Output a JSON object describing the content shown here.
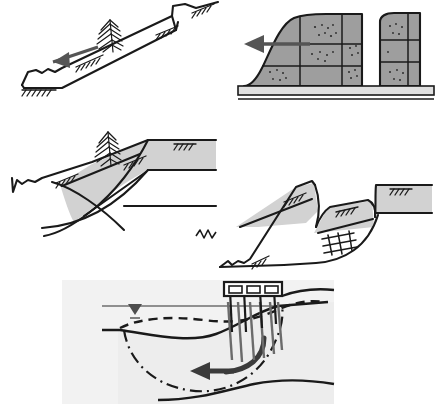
{
  "figure": {
    "title": "Types of seismically induced ground failure and slope movement",
    "background_color": "#ffffff",
    "line_color": "#1a1a1a",
    "fill_soil_color": "#c9c9c9",
    "fill_block_color": "#9e9e9e",
    "fill_base_color": "#e0e0e0",
    "fill_panel_color": "#f2f2f2",
    "arrow_color": "#555555",
    "water_color": "#8f8f8f"
  },
  "panels": [
    {
      "id": "panel-translational-slide",
      "name": "translational-block-slide",
      "index": 1,
      "position": "top-left",
      "description": "Translational block slide on a planar slope with head scarp, downslope displacement arrow and a tilted tree",
      "elements": [
        {
          "name": "ground-surface-line",
          "type": "line",
          "label": "ground surface"
        },
        {
          "name": "slide-plane-line",
          "type": "line",
          "label": "basal slide plane"
        },
        {
          "name": "head-scarp",
          "type": "step",
          "label": "head scarp"
        },
        {
          "name": "toe-bulge",
          "type": "bulge",
          "label": "toe bulge"
        },
        {
          "name": "movement-arrow",
          "type": "arrow",
          "label": "direction of movement",
          "direction": "downslope-left"
        },
        {
          "name": "tree-symbol",
          "type": "tree",
          "label": "tilted tree",
          "tilt_deg": -12
        },
        {
          "name": "ground-tick-marks",
          "type": "hatch",
          "count": 3,
          "label": "ground line ticks"
        }
      ]
    },
    {
      "id": "panel-lateral-spread",
      "name": "lateral-spreading-blocks",
      "index": 2,
      "position": "top-right",
      "description": "Lateral spreading of a jointed/blocky soil mass over a liquefiable base layer, with fissures separating intact blocks",
      "elements": [
        {
          "name": "soil-block",
          "type": "block",
          "label": "intact soil block",
          "count": 6
        },
        {
          "name": "fissure-gap",
          "type": "gap",
          "label": "open fissure",
          "count": 1
        },
        {
          "name": "liquefiable-base-layer",
          "type": "layer",
          "label": "liquefiable layer"
        },
        {
          "name": "movement-arrow",
          "type": "arrow",
          "label": "direction of spreading",
          "direction": "left"
        },
        {
          "name": "joint-line",
          "type": "line",
          "label": "joint / block boundary",
          "count": 8
        },
        {
          "name": "stipple-texture",
          "type": "texture",
          "label": "granular soil stipple"
        }
      ]
    },
    {
      "id": "panel-rotational-slump",
      "name": "rotational-slump",
      "index": 3,
      "position": "middle-left",
      "description": "Rotational slump with a single curved failure surface, back-tilted slide block, scarp and tilted tree",
      "elements": [
        {
          "name": "failure-surface-arc",
          "type": "arc",
          "label": "curved failure surface",
          "count": 3
        },
        {
          "name": "slide-block",
          "type": "block",
          "label": "back-rotated slump block"
        },
        {
          "name": "main-scarp",
          "type": "scarp",
          "label": "main scarp"
        },
        {
          "name": "tree-symbol",
          "type": "tree",
          "label": "tilted tree",
          "tilt_deg": -8
        },
        {
          "name": "ground-tick-marks",
          "type": "hatch",
          "count": 3,
          "label": "ground line ticks"
        },
        {
          "name": "original-ground-line",
          "type": "line",
          "label": "original ground surface"
        }
      ]
    },
    {
      "id": "panel-multiblock-slump",
      "name": "multi-block-slump",
      "index": 4,
      "position": "middle-right",
      "description": "Multiple retrogressive slump blocks with a graben, listric failure surface and a cross-hatched shear zone",
      "elements": [
        {
          "name": "upper-slide-block",
          "type": "block",
          "label": "upper slump block"
        },
        {
          "name": "lower-slide-block",
          "type": "block",
          "label": "lower slump block"
        },
        {
          "name": "graben",
          "type": "depression",
          "label": "graben between blocks"
        },
        {
          "name": "shear-zone-hatch",
          "type": "crosshatch",
          "label": "shear zone"
        },
        {
          "name": "failure-surface-arc",
          "type": "arc",
          "label": "listric failure surface"
        },
        {
          "name": "ground-tick-marks",
          "type": "hatch",
          "count": 4,
          "label": "ground line ticks"
        }
      ]
    },
    {
      "id": "panel-waterfront-failure",
      "name": "waterfront-wharf-failure",
      "index": 5,
      "position": "bottom-center",
      "description": "Submerged waterfront slope failure beneath a pile-supported wharf, showing original and deformed seabed profiles, a deep dash-dot failure surface and a curved flow arrow toward the water",
      "elements": [
        {
          "name": "water-surface-line",
          "type": "line",
          "label": "water surface"
        },
        {
          "name": "water-table-symbol",
          "type": "triangle",
          "label": "water level symbol"
        },
        {
          "name": "wharf-deck",
          "type": "structure",
          "label": "pile-supported wharf deck"
        },
        {
          "name": "wharf-pile",
          "type": "pile",
          "label": "bearing pile",
          "count": 6
        },
        {
          "name": "original-seabed-dashed",
          "type": "dashed-line",
          "label": "original seabed profile"
        },
        {
          "name": "deformed-seabed-solid",
          "type": "line",
          "label": "deformed seabed profile"
        },
        {
          "name": "deep-failure-surface",
          "type": "dash-dot-line",
          "label": "deep failure surface"
        },
        {
          "name": "flow-arrow",
          "type": "curved-arrow",
          "label": "direction of lateral flow",
          "direction": "toward-water-left"
        },
        {
          "name": "firm-stratum-line",
          "type": "line",
          "label": "firm underlying stratum"
        },
        {
          "name": "panel-background",
          "type": "fill",
          "label": "soil cross-section background"
        }
      ]
    }
  ]
}
